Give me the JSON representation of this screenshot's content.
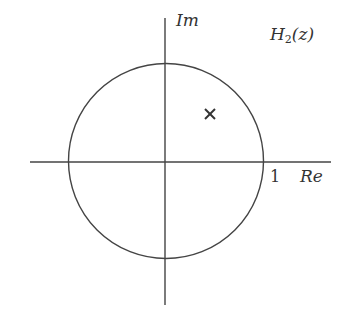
{
  "diagram": {
    "title": "H",
    "title_subscript": "2",
    "title_arg": "(z)",
    "axes": {
      "imag_label": "Im",
      "real_label": "Re",
      "unit_tick_label": "1"
    },
    "unit_circle": {
      "radius": 1
    },
    "pole": {
      "marker": "×",
      "description": "pole inside unit circle, first quadrant"
    },
    "colors": {
      "line": "#444444",
      "text": "#333333"
    }
  }
}
